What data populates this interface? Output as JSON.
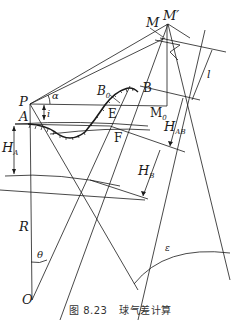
{
  "figure": {
    "caption_prefix": "图 8.23",
    "caption_title": "球气差计算",
    "labels": {
      "M": "M",
      "M_prime": "M′",
      "P": "P",
      "A": "A",
      "alpha": "α",
      "i": "i",
      "B": "B",
      "B0": "B",
      "B0_sub": "0",
      "E": "E",
      "F": "F",
      "M0": "M",
      "M0_sub": "0",
      "l": "l",
      "H_A": "H",
      "H_A_sub": "A",
      "H_AB": "H",
      "H_AB_sub": "AB",
      "H_B": "H",
      "H_B_sub": "B",
      "R": "R",
      "theta": "θ",
      "O": "O",
      "epsilon": "ε"
    },
    "colors": {
      "line": "#1a1a1a",
      "background": "#ffffff"
    }
  }
}
